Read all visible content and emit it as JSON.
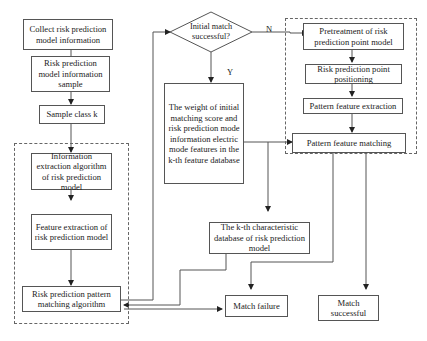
{
  "diagram": {
    "type": "flowchart",
    "nodes": {
      "collect": "Collect risk prediction model information",
      "sample": "Risk prediction model information sample",
      "class_k": "Sample class k",
      "info_extract": "Information extraction algorithm of risk prediction model",
      "feature_extract": "Feature extraction of risk prediction model",
      "pattern_matching_algo": "Risk prediction pattern matching algorithm",
      "initial_match": "Initial match successful?",
      "weight": "The weight of initial matching score and risk prediction mode information electric mode features in the k-th feature database",
      "kth_db": "The k-th characteristic database of risk prediction model",
      "match_failure": "Match failure",
      "pretreatment": "Pretreatment of risk prediction point model",
      "positioning": "Risk prediction point positioning",
      "pattern_extract": "Pattern feature extraction",
      "pattern_match": "Pattern feature matching",
      "match_success": "Match successful"
    },
    "edge_labels": {
      "no": "N",
      "yes": "Y"
    },
    "edges": [
      [
        "collect",
        "sample"
      ],
      [
        "sample",
        "class_k"
      ],
      [
        "class_k",
        "info_extract"
      ],
      [
        "info_extract",
        "feature_extract"
      ],
      [
        "feature_extract",
        "pattern_matching_algo"
      ],
      [
        "pattern_matching_algo",
        "initial_match"
      ],
      [
        "initial_match",
        "pretreatment",
        "N"
      ],
      [
        "initial_match",
        "weight",
        "Y"
      ],
      [
        "weight",
        "pattern_match"
      ],
      [
        "weight",
        "kth_db"
      ],
      [
        "kth_db",
        "pattern_matching_algo"
      ],
      [
        "pattern_matching_algo",
        "match_failure"
      ],
      [
        "pretreatment",
        "positioning"
      ],
      [
        "positioning",
        "pattern_extract"
      ],
      [
        "pattern_extract",
        "pattern_match"
      ],
      [
        "pattern_match",
        "match_failure"
      ],
      [
        "pattern_match",
        "match_success"
      ]
    ]
  }
}
